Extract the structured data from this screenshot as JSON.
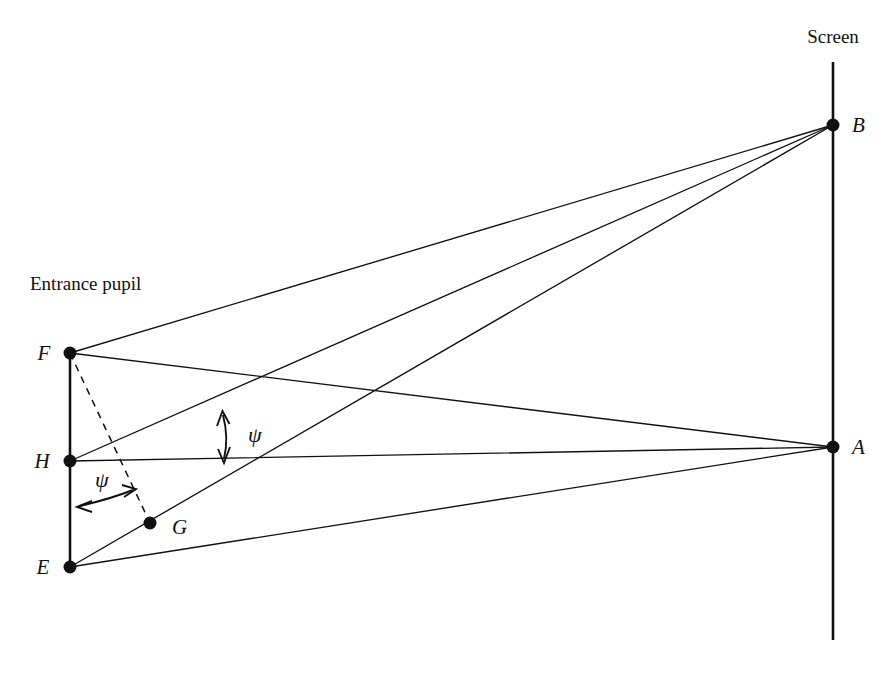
{
  "figure": {
    "background_color": "#ffffff",
    "line_color": "#111111"
  },
  "labels": {
    "screen": "Screen",
    "entrance_pupil": "Entrance pupil",
    "point_F": "F",
    "point_H": "H",
    "point_E": "E",
    "point_G": "G",
    "point_A": "A",
    "point_B": "B",
    "psi_upper": "ψ",
    "psi_lower": "ψ"
  },
  "geometry": {
    "points": [
      {
        "id": "F",
        "label": "F",
        "x": 70,
        "y": 353,
        "dot": true
      },
      {
        "id": "H",
        "label": "H",
        "x": 70,
        "y": 461,
        "dot": true
      },
      {
        "id": "E",
        "label": "E",
        "x": 70,
        "y": 567,
        "dot": true
      },
      {
        "id": "G",
        "label": "G",
        "x": 150,
        "y": 523,
        "dot": true
      },
      {
        "id": "B",
        "label": "B",
        "x": 833,
        "y": 125,
        "dot": true
      },
      {
        "id": "A",
        "label": "A",
        "x": 833,
        "y": 447,
        "dot": true
      }
    ],
    "pupil_axis": {
      "x": 70,
      "y1": 353,
      "y2": 567
    },
    "screen_axis": {
      "x": 833,
      "y1": 62,
      "y2": 640
    },
    "rays": [
      {
        "from": "F",
        "to": "B",
        "style": "solid"
      },
      {
        "from": "F",
        "to": "A",
        "style": "solid"
      },
      {
        "from": "H",
        "to": "B",
        "style": "solid"
      },
      {
        "from": "H",
        "to": "A",
        "style": "solid"
      },
      {
        "from": "E",
        "to": "B",
        "style": "solid"
      },
      {
        "from": "E",
        "to": "A",
        "style": "solid"
      },
      {
        "from": "F",
        "to": "G",
        "style": "dashed"
      }
    ],
    "angle_markers": [
      {
        "id": "psi-upper",
        "label": "ψ",
        "kind": "double-headed-arc",
        "x": 224,
        "y_top": 413,
        "y_bottom": 461
      },
      {
        "id": "psi-lower",
        "label": "ψ",
        "kind": "double-headed-arc",
        "x_left": 78,
        "x_right": 135,
        "y": 499
      }
    ]
  }
}
